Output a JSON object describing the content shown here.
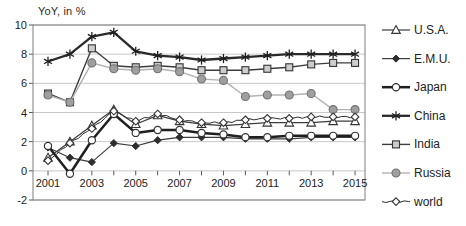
{
  "title": "YoY, in %",
  "chart_data": {
    "type": "line",
    "x": [
      2001,
      2002,
      2003,
      2004,
      2005,
      2006,
      2007,
      2008,
      2009,
      2010,
      2011,
      2012,
      2013,
      2014,
      2015
    ],
    "x_tick_labels": [
      "2001",
      "2003",
      "2005",
      "2007",
      "2009",
      "2011",
      "2013",
      "2015"
    ],
    "y_ticks": [
      -2,
      0,
      2,
      4,
      6,
      8,
      10
    ],
    "y_tick_labels": [
      "-2",
      "0",
      "2",
      "4",
      "6",
      "8",
      "10"
    ],
    "ylim": [
      -2,
      10
    ],
    "grid": true,
    "legend_position": "right",
    "series": [
      {
        "name": "U.S.A.",
        "marker": "triangle-open",
        "color": "#3d3d3d",
        "line_width": 1.2,
        "wavy": false,
        "values": [
          0.9,
          2.0,
          3.1,
          4.2,
          3.2,
          3.8,
          3.4,
          3.2,
          3.1,
          3.2,
          3.3,
          3.3,
          3.3,
          3.4,
          3.4
        ]
      },
      {
        "name": "E.M.U.",
        "marker": "diamond-filled",
        "color": "#3d3d3d",
        "line_width": 1.2,
        "wavy": false,
        "values": [
          1.6,
          0.9,
          0.6,
          1.9,
          1.7,
          2.1,
          2.3,
          2.3,
          2.3,
          2.2,
          2.2,
          2.2,
          2.3,
          2.3,
          2.3
        ]
      },
      {
        "name": "Japan",
        "marker": "circle-open",
        "color": "#1f1f1f",
        "line_width": 2.5,
        "wavy": false,
        "values": [
          1.7,
          -0.2,
          2.1,
          3.9,
          2.6,
          2.8,
          2.8,
          2.6,
          2.5,
          2.3,
          2.3,
          2.4,
          2.4,
          2.4,
          2.4
        ]
      },
      {
        "name": "China",
        "marker": "asterisk",
        "color": "#2a2a2a",
        "line_width": 2.3,
        "wavy": false,
        "values": [
          7.5,
          8.0,
          9.2,
          9.5,
          8.2,
          7.9,
          7.8,
          7.6,
          7.7,
          7.8,
          7.9,
          8.0,
          8.0,
          8.0,
          8.0
        ]
      },
      {
        "name": "India",
        "marker": "square-light",
        "color": "#3d3d3d",
        "line_width": 1.4,
        "wavy": false,
        "values": [
          5.3,
          4.7,
          8.4,
          7.2,
          7.1,
          7.2,
          7.1,
          6.9,
          6.9,
          6.9,
          7.0,
          7.1,
          7.3,
          7.4,
          7.4
        ]
      },
      {
        "name": "Russia",
        "marker": "circle-gray",
        "color": "#b2b2b2",
        "line_width": 1.4,
        "wavy": false,
        "values": [
          5.2,
          4.7,
          7.4,
          7.0,
          6.9,
          7.0,
          6.8,
          6.3,
          6.2,
          5.1,
          5.2,
          5.2,
          5.3,
          4.2,
          4.2
        ]
      },
      {
        "name": "world",
        "marker": "diamond-open",
        "color": "#2e2e2e",
        "line_width": 1.0,
        "wavy": true,
        "values": [
          0.7,
          1.9,
          2.9,
          4.1,
          3.4,
          3.9,
          3.5,
          3.3,
          3.3,
          3.5,
          3.6,
          3.6,
          3.7,
          3.7,
          3.7
        ]
      }
    ],
    "colors": {
      "grid": "#c8c8c8",
      "plot_border": "#7f7f7f",
      "tick": "#595959",
      "label": "#262626",
      "marker_fill_open": "#ffffff",
      "marker_fill_square": "#cdcdcd",
      "marker_fill_gray": "#9f9f9f",
      "marker_stroke_gray": "#737373"
    }
  }
}
